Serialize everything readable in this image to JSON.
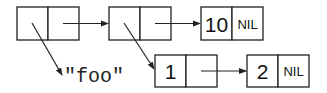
{
  "diagram": {
    "type": "cons-cell box-and-pointer diagram",
    "cells": [
      {
        "id": "c1",
        "car": "-> \"foo\"",
        "cdr": "-> c2"
      },
      {
        "id": "c2",
        "car": "-> c4",
        "cdr": "-> c3"
      },
      {
        "id": "c3",
        "car": "10",
        "cdr": "NIL"
      },
      {
        "id": "c4",
        "car": "1",
        "cdr": "-> c5"
      },
      {
        "id": "c5",
        "car": "2",
        "cdr": "NIL"
      }
    ],
    "labels": {
      "c3_car": "10",
      "c3_cdr": "NIL",
      "c4_car": "1",
      "c5_car": "2",
      "c5_cdr": "NIL",
      "string": "\"foo\""
    },
    "colors": {
      "line": "#222222",
      "background": "#ffffff"
    }
  }
}
